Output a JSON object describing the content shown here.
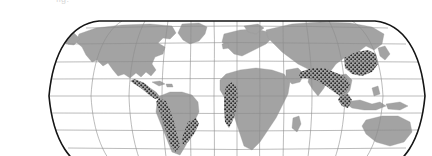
{
  "figure": {
    "type": "thematic-world-map",
    "projection": "Robinson",
    "caption_remnant": "fig.",
    "title": "",
    "subtitle": ""
  },
  "colors": {
    "background": "#ffffff",
    "ocean": "#ffffff",
    "land": "#a3a3a3",
    "land_edge": "#9a9a9a",
    "graticule": "#8d8d8d",
    "border": "#151515",
    "highlight_dot": "#2b2b2b",
    "caption": "#d8d8d8"
  },
  "map": {
    "frame": {
      "left_px": 48,
      "right_px": 426,
      "top_px": 21,
      "bottom_px": 172,
      "center_x_px": 237,
      "center_y_px": 96,
      "border_width_px": 1.6
    },
    "graticule": {
      "visible": true,
      "meridian_interval_deg": 30,
      "parallel_interval_deg": 20,
      "meridians_deg": [
        -180,
        -150,
        -120,
        -90,
        -60,
        -30,
        0,
        30,
        60,
        90,
        120,
        150,
        180
      ],
      "parallels_deg": [
        80,
        60,
        40,
        20,
        0,
        -20,
        -40,
        -60
      ],
      "line_width_px": 0.6
    },
    "legend": {
      "visible": false,
      "entries": [
        {
          "label": "",
          "swatch": "land",
          "color": "#a3a3a3"
        },
        {
          "label": "",
          "swatch": "stipple",
          "color": "#2b2b2b"
        }
      ]
    },
    "axis_labels": {
      "visible": false,
      "lon_ticks": [],
      "lat_ticks": []
    },
    "scale_bar": {
      "visible": false,
      "text": ""
    },
    "north_arrow": {
      "visible": false
    }
  },
  "highlight_regions": [
    {
      "name": "mesoamerica",
      "label": "",
      "pattern": "stipple",
      "dot_count": 34
    },
    {
      "name": "tropical-andes",
      "label": "",
      "pattern": "stipple",
      "dot_count": 46
    },
    {
      "name": "atlantic-forest-brazil",
      "label": "",
      "pattern": "stipple",
      "dot_count": 24
    },
    {
      "name": "guinean-west-africa",
      "label": "",
      "pattern": "stipple",
      "dot_count": 26
    },
    {
      "name": "himalaya-indo-burma",
      "label": "",
      "pattern": "stipple",
      "dot_count": 52
    },
    {
      "name": "south-china-taiwan",
      "label": "",
      "pattern": "stipple",
      "dot_count": 30
    },
    {
      "name": "sundaland-philippines",
      "label": "",
      "pattern": "stipple",
      "dot_count": 14
    }
  ],
  "continents": [
    {
      "name": "north-america",
      "highlighted": false
    },
    {
      "name": "south-america",
      "highlighted": true
    },
    {
      "name": "europe",
      "highlighted": false
    },
    {
      "name": "africa",
      "highlighted": true
    },
    {
      "name": "asia",
      "highlighted": true
    },
    {
      "name": "australia",
      "highlighted": false
    },
    {
      "name": "greenland",
      "highlighted": false
    }
  ]
}
